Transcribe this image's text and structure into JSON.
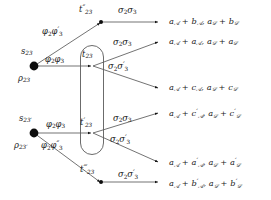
{
  "diagram": {
    "type": "node-edge-graph",
    "stroke_color": "#555555",
    "node_color": "#111111",
    "text_color": "#1a1a1a",
    "background": "#ffffff",
    "sources": [
      {
        "name": "source-top",
        "label_above": "s23",
        "label_below": "ρ23",
        "x": 34,
        "y": 66
      },
      {
        "name": "source-bottom",
        "label_above": "s23′",
        "label_below": "ρ23′",
        "x": 34,
        "y": 133
      }
    ],
    "inner_nodes": [
      {
        "name": "t23-double-prime",
        "label": "t″₂₃",
        "x": 101,
        "y": 22
      },
      {
        "name": "t23",
        "label": "t₂₃",
        "x": 92,
        "y": 66
      },
      {
        "name": "t23-prime",
        "label": "t′₂₃",
        "x": 92,
        "y": 133
      },
      {
        "name": "t23-triple-prime",
        "label": "t‴₂₃",
        "x": 101,
        "y": 182
      }
    ],
    "group_box": {
      "name": "pill-group",
      "x": 80,
      "y": 45,
      "width": 24,
      "height": 110,
      "radius": 12
    },
    "input_edge_labels": [
      {
        "name": "edge-label-phi2-phi3-prime",
        "text": "φ₂φ′₃"
      },
      {
        "name": "edge-label-phi2-phi3",
        "text": "φ₂φ₃"
      },
      {
        "name": "edge-label-phi2-phi3-bottom",
        "text": "φ₂φ₃"
      },
      {
        "name": "edge-label-phi2-phi3-dprime",
        "text": "φ₂φ″₃"
      }
    ],
    "output_edge_labels": [
      {
        "name": "sigma-label-1",
        "text": "σ₂σ₃"
      },
      {
        "name": "sigma-label-2",
        "text": "σ₂σ₃"
      },
      {
        "name": "sigma-label-3",
        "text": "σ₂σ′₃"
      },
      {
        "name": "sigma-label-4",
        "text": "σ₂σ₃"
      },
      {
        "name": "sigma-label-5",
        "text": "σ₂σ′₃"
      },
      {
        "name": "sigma-label-6",
        "text": "σ₂σ′₃"
      }
    ],
    "outputs": [
      {
        "name": "output-row-1",
        "text": "aᴀ + bᴀ, aʙ + bʙ",
        "y": 23
      },
      {
        "name": "output-row-2",
        "text": "aᴀ + aᴀ, aʙ + aʙ",
        "y": 43
      },
      {
        "name": "output-row-3",
        "text": "aᴀ + cᴀ, aʙ + cʙ",
        "y": 89
      },
      {
        "name": "output-row-4",
        "text": "aᴀ + c′ᴀ, aʙ + c′ʙ",
        "y": 114
      },
      {
        "name": "output-row-5",
        "text": "aᴀ + a′ᴀ, aʙ + a′ʙ",
        "y": 163
      },
      {
        "name": "output-row-6",
        "text": "aᴀ + b′ᴀ, aʙ + b′ʙ",
        "y": 184
      }
    ]
  }
}
